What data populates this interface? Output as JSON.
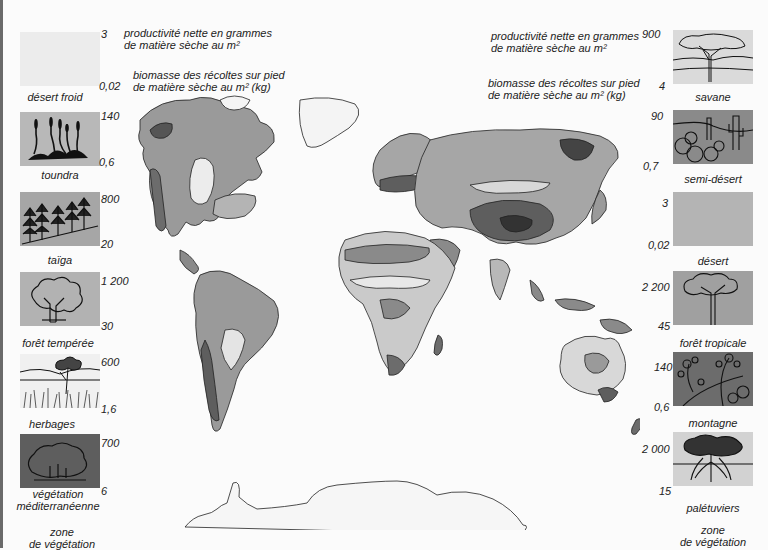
{
  "header_left": {
    "productivity_line1": "productivité nette en grammes",
    "productivity_line2": "de matière sèche au m²",
    "biomass_line1": "biomasse des récoltes sur pied",
    "biomass_line2": "de matière sèche au m² (kg)"
  },
  "header_right": {
    "productivity_line1": "productivité nette en grammes",
    "productivity_line2": "de matière sèche au m²",
    "biomass_line1": "biomasse des récoltes sur pied",
    "biomass_line2": "de matière sèche au m² (kg)"
  },
  "legend_left": [
    {
      "name": "désert froid",
      "productivity": "3",
      "biomass": "0,02",
      "shade": "#ececec",
      "icon": "blank"
    },
    {
      "name": "toundra",
      "productivity": "140",
      "biomass": "0,6",
      "shade": "#b8b8b8",
      "icon": "grass-tufts"
    },
    {
      "name": "taïga",
      "productivity": "800",
      "biomass": "20",
      "shade": "#a6a6a6",
      "icon": "conifers"
    },
    {
      "name": "forêt tempérée",
      "productivity": "1 200",
      "biomass": "30",
      "shade": "#b2b2b2",
      "icon": "deciduous-tree"
    },
    {
      "name": "herbages",
      "productivity": "600",
      "biomass": "1,6",
      "shade": "#f0f0f0",
      "icon": "grassland-tree"
    },
    {
      "name": "végétation méditerranéenne",
      "productivity": "700",
      "biomass": "6",
      "shade": "#5e5e5e",
      "icon": "shrub"
    }
  ],
  "legend_right": [
    {
      "name": "savane",
      "productivity": "900",
      "biomass": "4",
      "shade": "#dadada",
      "icon": "acacia"
    },
    {
      "name": "semi-désert",
      "productivity": "90",
      "biomass": "0,7",
      "shade": "#8a8a8a",
      "icon": "cactus"
    },
    {
      "name": "désert",
      "productivity": "3",
      "biomass": "0,02",
      "shade": "#b4b4b4",
      "icon": "blank"
    },
    {
      "name": "forêt tropicale",
      "productivity": "2 200",
      "biomass": "45",
      "shade": "#a0a0a0",
      "icon": "tall-tree"
    },
    {
      "name": "montagne",
      "productivity": "140",
      "biomass": "0,6",
      "shade": "#6c6c6c",
      "icon": "alpine-flowers"
    },
    {
      "name": "palétuviers",
      "productivity": "2 000",
      "biomass": "15",
      "shade": "#d2d2d2",
      "icon": "mangrove"
    }
  ],
  "footer_left": {
    "line1": "zone",
    "line2": "de végétation"
  },
  "footer_right": {
    "line1": "zone",
    "line2": "de végétation"
  },
  "map": {
    "title": "Zones de végétation du monde",
    "projection": "world map, grayscale"
  }
}
